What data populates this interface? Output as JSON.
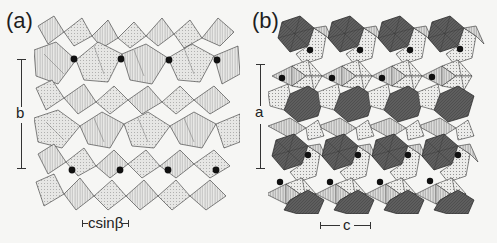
{
  "figure": {
    "panels": [
      {
        "id": "a",
        "label": "(a)",
        "vertical_axis": "b",
        "horizontal_axis": "csinβ",
        "dots_per_row": 4,
        "dot_rows": 2
      },
      {
        "id": "b",
        "label": "(b)",
        "vertical_axis": "a",
        "horizontal_axis": "c",
        "dots_per_row": 4,
        "dot_rows": 4
      }
    ]
  },
  "colors": {
    "background": "#f6f6f4",
    "polyhedron_light": "#e4e4e2",
    "polyhedron_dark": "#5a5a5a",
    "edge": "#333333",
    "dot": "#111111"
  }
}
